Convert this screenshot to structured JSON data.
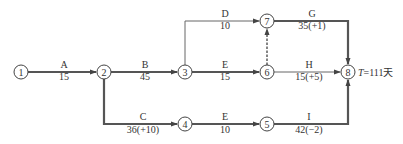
{
  "diagram": {
    "type": "double-code network (arrow diagram)",
    "nodes": [
      {
        "id": "1",
        "label": "1",
        "x": 21,
        "y": 72
      },
      {
        "id": "2",
        "label": "2",
        "x": 104,
        "y": 72
      },
      {
        "id": "3",
        "label": "3",
        "x": 185,
        "y": 72
      },
      {
        "id": "4",
        "label": "4",
        "x": 185,
        "y": 124
      },
      {
        "id": "5",
        "label": "5",
        "x": 267,
        "y": 124
      },
      {
        "id": "6",
        "label": "6",
        "x": 267,
        "y": 72
      },
      {
        "id": "7",
        "label": "7",
        "x": 267,
        "y": 21
      },
      {
        "id": "8",
        "label": "8",
        "x": 348,
        "y": 72
      }
    ],
    "activities": [
      {
        "id": "A",
        "from": "1",
        "to": "2",
        "name": "A",
        "duration": "15",
        "critical": true
      },
      {
        "id": "B",
        "from": "2",
        "to": "3",
        "name": "B",
        "duration": "45",
        "critical": true
      },
      {
        "id": "C",
        "from": "2",
        "to": "4",
        "name": "C",
        "duration": "36(+10)",
        "critical": true
      },
      {
        "id": "D",
        "from": "3",
        "to": "7",
        "name": "D",
        "duration": "10",
        "critical": false
      },
      {
        "id": "E1",
        "from": "3",
        "to": "6",
        "name": "E",
        "duration": "15",
        "critical": true
      },
      {
        "id": "E2",
        "from": "4",
        "to": "5",
        "name": "E",
        "duration": "10",
        "critical": true
      },
      {
        "id": "G",
        "from": "7",
        "to": "8",
        "name": "G",
        "duration": "35(+1)",
        "critical": true
      },
      {
        "id": "H",
        "from": "6",
        "to": "8",
        "name": "H",
        "duration": "15(+5)",
        "critical": false
      },
      {
        "id": "I",
        "from": "5",
        "to": "8",
        "name": "I",
        "duration": "42(−2)",
        "critical": true
      },
      {
        "id": "dummy",
        "from": "6",
        "to": "7",
        "name": "",
        "duration": "",
        "dummy": true,
        "critical": true
      }
    ],
    "total_duration": {
      "symbol": "T",
      "text": "=111天"
    }
  }
}
